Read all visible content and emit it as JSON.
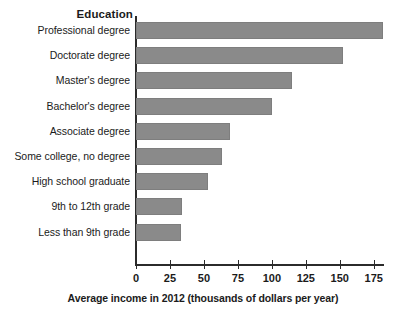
{
  "chart_data": {
    "type": "bar",
    "orientation": "horizontal",
    "title": "",
    "xlabel": "Average income in 2012 (thousands of dollars per year)",
    "ylabel": "Education",
    "categories": [
      "Professional degree",
      "Doctorate degree",
      "Master's degree",
      "Bachelor's degree",
      "Associate degree",
      "Some college, no degree",
      "High school graduate",
      "9th to 12th grade",
      "Less than 9th grade"
    ],
    "values": [
      182,
      152,
      115,
      100,
      69,
      63,
      53,
      34,
      33
    ],
    "xlim": [
      0,
      190
    ],
    "xticks": [
      0,
      25,
      50,
      75,
      100,
      125,
      150,
      175
    ],
    "xtick_labels": [
      "0",
      "25",
      "50",
      "75",
      "100",
      "125",
      "150",
      "175"
    ],
    "grid": false,
    "legend": null,
    "bar_color": "#8a8a8a",
    "axis_color": "#2b2b2b",
    "text_color": "#1b1b1b"
  }
}
